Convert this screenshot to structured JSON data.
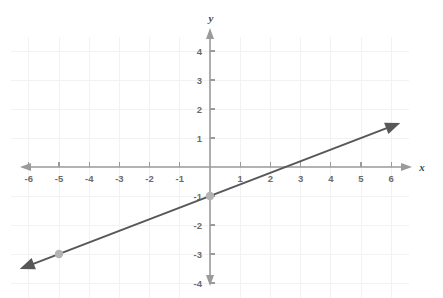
{
  "figure": {
    "kind": "coordinate-plane-graph",
    "background_color": "#ffffff",
    "width": 443,
    "height": 298
  },
  "axes": {
    "x_label": "x",
    "y_label": "y",
    "axis_color": "#9a9a9a",
    "gridline_color": "#f2f2f2",
    "tick_label_color": "#6b6b6b",
    "x_tick_labels": [
      "-6",
      "-5",
      "-4",
      "-3",
      "-2",
      "-1",
      "1",
      "2",
      "3",
      "4",
      "5",
      "6"
    ],
    "y_tick_labels": [
      "4",
      "3",
      "2",
      "1",
      "-1",
      "-2",
      "-3",
      "-4"
    ]
  },
  "chart_data": {
    "type": "line",
    "title": "",
    "xlabel": "x",
    "ylabel": "y",
    "xlim": [
      -6.8,
      6.8
    ],
    "ylim": [
      -4.6,
      4.6
    ],
    "xticks": [
      -6,
      -5,
      -4,
      -3,
      -2,
      -1,
      1,
      2,
      3,
      4,
      5,
      6
    ],
    "yticks": [
      4,
      3,
      2,
      1,
      -1,
      -2,
      -3,
      -4
    ],
    "grid": true,
    "legend": "none",
    "series": [
      {
        "name": "line",
        "equation": "y = 0.4x - 1",
        "slope": 0.4,
        "y_intercept": -1,
        "x_intercept": 2.5,
        "color": "#585858",
        "arrows": "both",
        "x": [
          -6.3,
          6.3
        ],
        "y": [
          -3.52,
          1.52
        ],
        "marked_points": [
          {
            "x": 0,
            "y": -1,
            "color": "#b3b3b3"
          },
          {
            "x": -5,
            "y": -3,
            "color": "#b3b3b3"
          }
        ]
      }
    ]
  }
}
